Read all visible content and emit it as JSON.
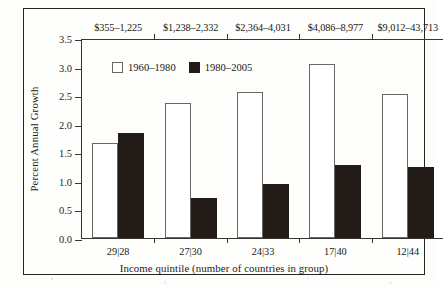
{
  "chart_data": {
    "type": "bar",
    "title": "",
    "subtitle": "",
    "xlabel": "Income quintile (number of countries in group)",
    "ylabel": "Percent Annual Growth",
    "ylim": [
      0.0,
      3.5
    ],
    "ytick_labels": [
      "0.0",
      "0.5",
      "1.0",
      "1.5",
      "2.0",
      "2.5",
      "3.0",
      "3.5"
    ],
    "ytick_values": [
      0.0,
      0.5,
      1.0,
      1.5,
      2.0,
      2.5,
      3.0,
      3.5
    ],
    "grid": false,
    "legend_position": "upper-left-inside",
    "categories": [
      "29|28",
      "27|30",
      "24|33",
      "17|40",
      "12|44"
    ],
    "top_axis_label": "",
    "top_categories": [
      "$355–1,225",
      "$1,238–2,332",
      "$2,364–4,031",
      "$4,086–8,977",
      "$9,012–43,713"
    ],
    "series": [
      {
        "name": "1960–1980",
        "color": "#ffffff",
        "edge_color": "#6b6662",
        "values": [
          1.67,
          2.37,
          2.55,
          3.05,
          2.52
        ]
      },
      {
        "name": "1980–2005",
        "color": "#221c18",
        "edge_color": "#221c18",
        "values": [
          1.83,
          0.7,
          0.95,
          1.28,
          1.24
        ]
      }
    ]
  },
  "legend": {
    "items": [
      {
        "label": "1960–1980",
        "swatch": "white"
      },
      {
        "label": "1980–2005",
        "swatch": "black"
      }
    ]
  },
  "axes": {
    "y_title": "Percent Annual Growth",
    "x_title": "Income quintile (number of countries in group)"
  },
  "colors": {
    "bar_white_fill": "#ffffff",
    "bar_white_edge": "#6b6662",
    "bar_black_fill": "#221c18",
    "axis": "#3a332e",
    "frame": "#2a2522",
    "text": "#1d1916",
    "page": "#fdfdfb"
  }
}
